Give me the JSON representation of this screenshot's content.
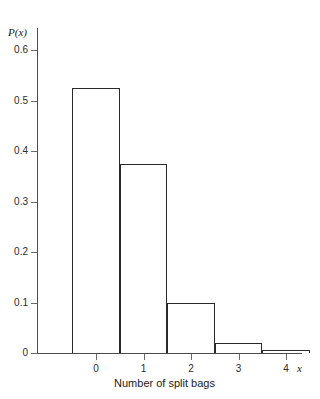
{
  "chart_data": {
    "type": "bar",
    "title": "",
    "subtitle": "",
    "xlabel": "Number of split bags",
    "ylabel": "P(x)",
    "x_variable_label": "x",
    "categories": [
      "0",
      "1",
      "2",
      "3",
      "4"
    ],
    "values": [
      0.525,
      0.375,
      0.1,
      0.02,
      0.005
    ],
    "series": [
      {
        "name": "P(x)",
        "values": [
          0.525,
          0.375,
          0.1,
          0.02,
          0.005
        ]
      }
    ],
    "xlim": [
      -0.9,
      5.0
    ],
    "ylim": [
      0,
      0.65
    ],
    "y_ticks": [
      0,
      0.1,
      0.2,
      0.3,
      0.4,
      0.5,
      0.6
    ],
    "y_tick_labels": [
      "0",
      "0.1",
      "0.2",
      "0.3",
      "0.4",
      "0.5",
      "0.6"
    ],
    "x_ticks": [
      0,
      1,
      2,
      3,
      4
    ],
    "x_tick_labels": [
      "0",
      "1",
      "2",
      "3",
      "4"
    ],
    "grid": false,
    "legend": false,
    "legend_position": "none",
    "bar_style": "outline",
    "bar_width": 1.0,
    "bar_edge_color": "#2a2a2a",
    "bar_fill_color": "#ffffff",
    "axis_color": "#4d4d4d",
    "background_color": "#ffffff"
  },
  "caption": {
    "text": ""
  }
}
